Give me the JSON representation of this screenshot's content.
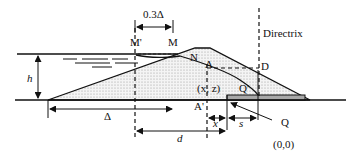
{
  "diagram": {
    "labels": {
      "offset": "0.3Δ",
      "m_prime": "M'",
      "m": "M",
      "n": "N",
      "directrix": "Directrix",
      "a": "A",
      "d_point": "D",
      "h": "h",
      "a_prime": "A'",
      "xz": "(x, z)",
      "q_prime": "Q'",
      "delta": "Δ",
      "x": "x",
      "s": "s",
      "d": "d",
      "q": "Q",
      "origin": "(0,0)"
    },
    "colors": {
      "line": "#111111",
      "fill_dots": "#bdbdbd",
      "drain": "#a8a8a8"
    }
  }
}
